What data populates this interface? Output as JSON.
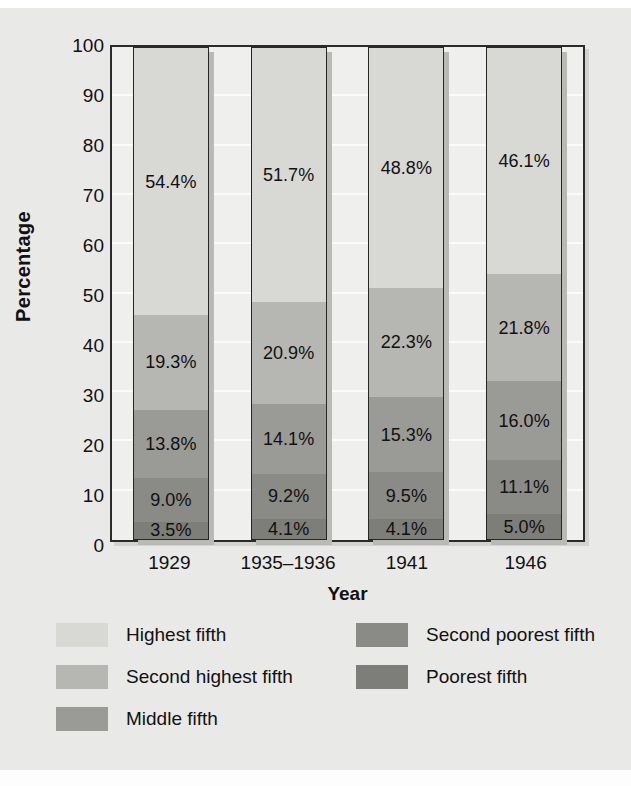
{
  "axes": {
    "ylabel": "Percentage",
    "xlabel": "Year",
    "yticks": [
      "100",
      "90",
      "80",
      "70",
      "60",
      "50",
      "40",
      "30",
      "20",
      "10",
      "0"
    ],
    "xticks": [
      "1929",
      "1935–1936",
      "1941",
      "1946"
    ]
  },
  "legend": [
    {
      "label": "Highest fifth",
      "color": "#d8d8d5",
      "col": 0,
      "row": 0
    },
    {
      "label": "Second highest fifth",
      "color": "#b6b6b2",
      "col": 0,
      "row": 1
    },
    {
      "label": "Middle fifth",
      "color": "#9a9a96",
      "col": 0,
      "row": 2
    },
    {
      "label": "Second poorest fifth",
      "color": "#8a8a86",
      "col": 1,
      "row": 0
    },
    {
      "label": "Poorest fifth",
      "color": "#7d7d79",
      "col": 1,
      "row": 1
    }
  ],
  "chart_data": {
    "type": "bar",
    "subtype": "stacked-bar-100",
    "title": "",
    "xlabel": "Year",
    "ylabel": "Percentage",
    "ylim": [
      0,
      100
    ],
    "yticks": [
      0,
      10,
      20,
      30,
      40,
      50,
      60,
      70,
      80,
      90,
      100
    ],
    "grid": true,
    "legend_position": "bottom",
    "categories": [
      "1929",
      "1935–1936",
      "1941",
      "1946"
    ],
    "series": [
      {
        "name": "Highest fifth",
        "color": "#d8d8d5",
        "values": [
          54.4,
          51.7,
          48.8,
          46.1
        ],
        "labels": [
          "54.4%",
          "51.7%",
          "48.8%",
          "46.1%"
        ]
      },
      {
        "name": "Second highest fifth",
        "color": "#b6b6b2",
        "values": [
          19.3,
          20.9,
          22.3,
          21.8
        ],
        "labels": [
          "19.3%",
          "20.9%",
          "22.3%",
          "21.8%"
        ]
      },
      {
        "name": "Middle fifth",
        "color": "#9a9a96",
        "values": [
          13.8,
          14.1,
          15.3,
          16.0
        ],
        "labels": [
          "13.8%",
          "14.1%",
          "15.3%",
          "16.0%"
        ]
      },
      {
        "name": "Second poorest fifth",
        "color": "#8a8a86",
        "values": [
          9.0,
          9.2,
          9.5,
          11.1
        ],
        "labels": [
          "9.0%",
          "9.2%",
          "9.5%",
          "11.1%"
        ]
      },
      {
        "name": "Poorest fifth",
        "color": "#7d7d79",
        "values": [
          3.5,
          4.1,
          4.1,
          5.0
        ],
        "labels": [
          "3.5%",
          "4.1%",
          "4.1%",
          "5.0%"
        ]
      }
    ]
  }
}
